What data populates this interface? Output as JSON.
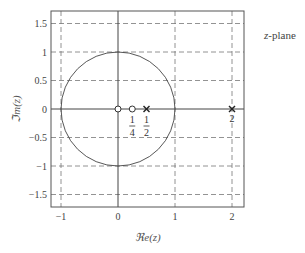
{
  "chart_data": {
    "type": "scatter",
    "title": "",
    "annotation": "z-plane",
    "xlabel": "ℜe(z)",
    "ylabel": "ℑm(z)",
    "xlim": [
      -1.2,
      2.2
    ],
    "ylim": [
      -1.7,
      1.7
    ],
    "xticks": [
      -1,
      0,
      1,
      2
    ],
    "xtick_labels": [
      "−1",
      "0",
      "1",
      "2"
    ],
    "yticks": [
      1.5,
      1,
      0.5,
      0,
      -0.5,
      -1,
      -1.5
    ],
    "ytick_labels": [
      "1.5",
      "1",
      "0.5",
      "0",
      "−0.5",
      "−1",
      "−1.5"
    ],
    "grid": "dashed",
    "unit_circle": {
      "center": [
        0,
        0
      ],
      "radius": 1
    },
    "series": [
      {
        "name": "zeros",
        "marker": "o",
        "points": [
          [
            0,
            0
          ],
          [
            0.25,
            0
          ]
        ]
      },
      {
        "name": "poles",
        "marker": "x",
        "points": [
          [
            0.5,
            0
          ],
          [
            2,
            0
          ]
        ]
      }
    ],
    "point_labels": [
      {
        "x": 0.25,
        "num": "1",
        "den": "4"
      },
      {
        "x": 0.5,
        "num": "1",
        "den": "2"
      },
      {
        "x": 2,
        "text": "2"
      }
    ]
  },
  "labels": {
    "plane_prefix": "z",
    "plane_suffix": "-plane",
    "xlabel": "ℜe(z)",
    "ylabel": "ℑm(z)"
  }
}
